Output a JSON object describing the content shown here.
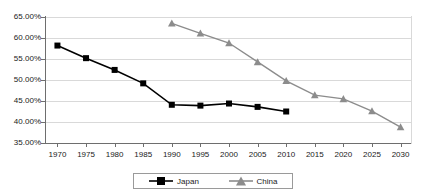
{
  "chart_data": {
    "type": "line",
    "title": "",
    "subtitle": "",
    "xlabel": "",
    "ylabel": "",
    "xlim": [
      1968,
      2032
    ],
    "ylim": [
      35,
      65
    ],
    "y_tick_format": "percent_2dp",
    "grid": "horizontal",
    "legend_position": "bottom",
    "x_ticks": [
      1970,
      1975,
      1980,
      1985,
      1990,
      1995,
      2000,
      2005,
      2010,
      2015,
      2020,
      2025,
      2030
    ],
    "x_tick_labels": [
      "1970",
      "1975",
      "1980",
      "1985",
      "1990",
      "1995",
      "2000",
      "2005",
      "2010",
      "2015",
      "2020",
      "2025",
      "2030"
    ],
    "y_ticks": [
      35,
      40,
      45,
      50,
      55,
      60,
      65
    ],
    "y_tick_labels": [
      "35.00%",
      "40.00%",
      "45.00%",
      "50.00%",
      "55.00%",
      "60.00%",
      "65.00%"
    ],
    "series": [
      {
        "name": "Japan",
        "color": "#000000",
        "marker": "square",
        "marker_color": "#000000",
        "x": [
          1970,
          1975,
          1980,
          1985,
          1990,
          1995,
          2000,
          2005,
          2010
        ],
        "values": [
          58.2,
          55.2,
          52.4,
          49.2,
          44.1,
          43.9,
          44.4,
          43.6,
          42.5
        ]
      },
      {
        "name": "China",
        "color": "#8c8c8c",
        "marker": "triangle",
        "marker_color": "#8c8c8c",
        "x": [
          1990,
          1995,
          2000,
          2005,
          2010,
          2015,
          2020,
          2025,
          2030
        ],
        "values": [
          63.5,
          61.1,
          58.8,
          54.3,
          49.8,
          46.4,
          45.5,
          42.6,
          38.8
        ]
      }
    ]
  },
  "legend": {
    "entries": [
      {
        "label": "Japan"
      },
      {
        "label": "China"
      }
    ]
  }
}
